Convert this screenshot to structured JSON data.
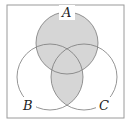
{
  "diagram": {
    "type": "venn",
    "sets": [
      {
        "name": "A",
        "label": "A"
      },
      {
        "name": "B",
        "label": "B"
      },
      {
        "name": "C",
        "label": "C"
      }
    ],
    "shaded_region": "A ∪ (B ∩ C)",
    "colors": {
      "shade": "#d6d6d6",
      "stroke": "#7a7a7a",
      "frame": "#9a9a9a",
      "background": "#ffffff"
    }
  }
}
